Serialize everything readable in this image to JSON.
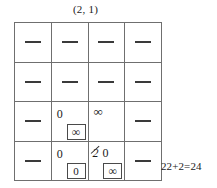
{
  "figure": {
    "caption": "(2, 1)",
    "note": "22+2=24"
  },
  "grid": {
    "rows": 4,
    "cols": 4,
    "cells": [
      [
        {
          "mark": "dash",
          "value": "—"
        },
        {
          "mark": "dash",
          "value": "—"
        },
        {
          "mark": "dash",
          "value": "—"
        },
        {
          "mark": "dash",
          "value": "—"
        }
      ],
      [
        {
          "mark": "dash",
          "value": "—"
        },
        {
          "mark": "dash",
          "value": "—"
        },
        {
          "mark": "dash",
          "value": "—"
        },
        {
          "mark": "dash",
          "value": "—"
        }
      ],
      [
        {
          "mark": "dash",
          "value": "—"
        },
        {
          "mark": "value",
          "value": "0",
          "sub": "∞"
        },
        {
          "mark": "value",
          "value": "∞"
        },
        {
          "mark": "dash",
          "value": "—"
        }
      ],
      [
        {
          "mark": "dash",
          "value": "—"
        },
        {
          "mark": "value",
          "value": "0",
          "sub": "0"
        },
        {
          "mark": "struck",
          "struck_value": "2",
          "value": "0",
          "sub": "∞"
        },
        {
          "mark": "dash",
          "value": "—"
        }
      ]
    ]
  },
  "colors": {
    "background": "#ffffff",
    "grid_line": "#6f6f6f",
    "text": "#1a1a1a",
    "dash": "#3a3a3a"
  }
}
